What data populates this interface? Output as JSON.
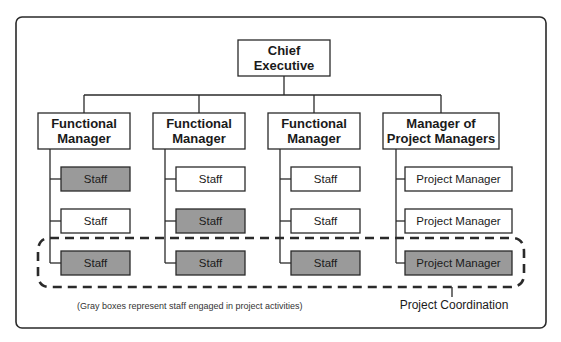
{
  "colors": {
    "engaged_fill": "#9a9a9a",
    "normal_fill": "#ffffff",
    "line": "#2a2a2a"
  },
  "top": {
    "label_line1": "Chief",
    "label_line2": "Executive"
  },
  "columns": [
    {
      "manager_line1": "Functional",
      "manager_line2": "Manager",
      "staff": [
        {
          "label": "Staff",
          "engaged": true
        },
        {
          "label": "Staff",
          "engaged": false
        },
        {
          "label": "Staff",
          "engaged": true
        }
      ]
    },
    {
      "manager_line1": "Functional",
      "manager_line2": "Manager",
      "staff": [
        {
          "label": "Staff",
          "engaged": false
        },
        {
          "label": "Staff",
          "engaged": true
        },
        {
          "label": "Staff",
          "engaged": true
        }
      ]
    },
    {
      "manager_line1": "Functional",
      "manager_line2": "Manager",
      "staff": [
        {
          "label": "Staff",
          "engaged": false
        },
        {
          "label": "Staff",
          "engaged": false
        },
        {
          "label": "Staff",
          "engaged": true
        }
      ]
    },
    {
      "manager_line1": "Manager of",
      "manager_line2": "Project Managers",
      "staff": [
        {
          "label": "Project Manager",
          "engaged": false
        },
        {
          "label": "Project Manager",
          "engaged": false
        },
        {
          "label": "Project Manager",
          "engaged": true
        }
      ]
    }
  ],
  "caption": "(Gray boxes represent staff engaged in project activities)",
  "coordination_label": "Project Coordination"
}
